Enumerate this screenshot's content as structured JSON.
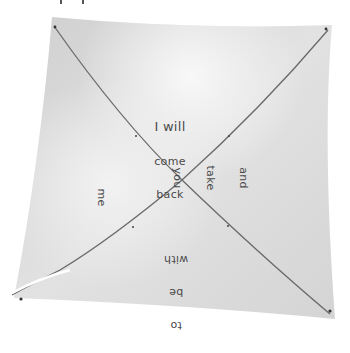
{
  "image": {
    "subject": "folded square paper with X-shaped crease and handwritten message",
    "background_color": "#ffffff",
    "paper_color": "#d9d9d9",
    "crease_color": "#6a6a6a",
    "highlight_color": "#f4f4f4"
  },
  "handwriting": {
    "top": [
      "I will",
      "come",
      "back"
    ],
    "right": [
      "and",
      "take",
      "you"
    ],
    "bottom": [
      "with",
      "be",
      "to"
    ],
    "left": [
      "me"
    ]
  },
  "message": "I will come back and take you to be with me"
}
